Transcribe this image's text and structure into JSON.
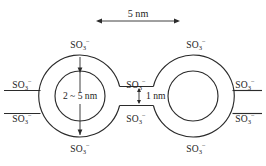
{
  "figure": {
    "background_color": "#ffffff",
    "line_color": "#2b2b2b",
    "text_color": "#1c1c1c"
  },
  "scale_bar": {
    "label": "5 nm",
    "x_start": 96,
    "x_end": 180,
    "y": 21
  },
  "dimensions": {
    "diameter": {
      "label": "2 ~ 5 nm",
      "x": 80,
      "y": 99
    },
    "wall_gap": {
      "label": "1 nm",
      "x": 156,
      "y": 99
    }
  },
  "rings": [
    {
      "name": "left-ring",
      "cx": 80,
      "cy": 96,
      "r_outer": 41,
      "r_inner": 25
    },
    {
      "name": "right-ring",
      "cx": 193,
      "cy": 96,
      "r_outer": 41,
      "r_inner": 25
    }
  ],
  "ion_labels": [
    {
      "name": "left-ring-top",
      "text": "SO",
      "sub": "3",
      "sup": "−",
      "x": 80,
      "y": 48,
      "anchor": "middle"
    },
    {
      "name": "left-ring-bottom",
      "text": "SO",
      "sub": "3",
      "sup": "−",
      "x": 80,
      "y": 152,
      "anchor": "middle"
    },
    {
      "name": "left-outer-upper",
      "text": "SO",
      "sub": "3",
      "sup": "−",
      "x": 22,
      "y": 88,
      "anchor": "middle"
    },
    {
      "name": "left-outer-lower",
      "text": "SO",
      "sub": "3",
      "sup": "−",
      "x": 22,
      "y": 122,
      "anchor": "middle"
    },
    {
      "name": "center-upper",
      "text": "SO",
      "sub": "3",
      "sup": "−",
      "x": 136,
      "y": 88,
      "anchor": "middle"
    },
    {
      "name": "center-lower",
      "text": "SO",
      "sub": "3",
      "sup": "−",
      "x": 136,
      "y": 122,
      "anchor": "middle"
    },
    {
      "name": "right-ring-top",
      "text": "SO",
      "sub": "3",
      "sup": "−",
      "x": 196,
      "y": 48,
      "anchor": "middle"
    },
    {
      "name": "right-ring-bottom",
      "text": "SO",
      "sub": "3",
      "sup": "−",
      "x": 196,
      "y": 152,
      "anchor": "middle"
    },
    {
      "name": "right-outer-upper",
      "text": "SO",
      "sub": "3",
      "sup": "−",
      "x": 245,
      "y": 88,
      "anchor": "middle"
    },
    {
      "name": "right-outer-lower",
      "text": "SO",
      "sub": "3",
      "sup": "−",
      "x": 245,
      "y": 122,
      "anchor": "middle"
    }
  ]
}
